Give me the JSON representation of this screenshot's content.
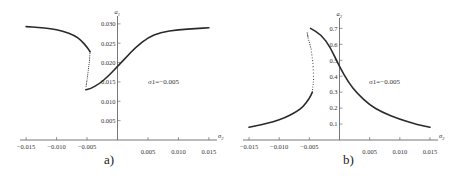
{
  "figure": {
    "panels": [
      {
        "label": "a)",
        "ylabel": "a",
        "ylabel_sub": "1",
        "xlabel": "σ",
        "xlabel_sub": "2",
        "annotation": "σ₁=−0.005"
      },
      {
        "label": "b)",
        "ylabel": "a",
        "ylabel_sub": "2",
        "xlabel": "σ",
        "xlabel_sub": "2",
        "annotation": "σ₁=−0.005"
      }
    ]
  },
  "chart_data": [
    {
      "type": "line",
      "title": "",
      "panel_label": "a)",
      "xlabel": "σ2",
      "ylabel": "a1",
      "annotation": "σ1=−0.005",
      "xlim": [
        -0.016,
        0.016
      ],
      "ylim": [
        0,
        0.031
      ],
      "xticks": [
        -0.015,
        -0.01,
        -0.005,
        0.005,
        0.01,
        0.015
      ],
      "xtick_labels": [
        "−0.015",
        "−0.010",
        "−0.005",
        "0.005",
        "0.010",
        "0.015"
      ],
      "yticks": [
        0.005,
        0.01,
        0.015,
        0.02,
        0.025,
        0.03
      ],
      "ytick_labels": [
        "0.005",
        "0.010",
        "0.015",
        "0.020",
        "0.025",
        "0.030"
      ],
      "grid": false,
      "series": [
        {
          "name": "stable upper branch",
          "style": "solid",
          "x": [
            -0.015,
            -0.013,
            -0.011,
            -0.009,
            -0.007,
            -0.006,
            -0.005,
            -0.0045
          ],
          "y": [
            0.0293,
            0.0291,
            0.0288,
            0.0282,
            0.027,
            0.0258,
            0.024,
            0.0228
          ]
        },
        {
          "name": "unstable branch",
          "style": "dotted",
          "x": [
            -0.0045,
            -0.0046,
            -0.0048,
            -0.005,
            -0.0052
          ],
          "y": [
            0.0228,
            0.0205,
            0.018,
            0.0155,
            0.0135
          ]
        },
        {
          "name": "stable lower branch",
          "style": "solid",
          "x": [
            -0.0052,
            -0.0045,
            -0.003,
            -0.0015,
            0.0,
            0.0015,
            0.003,
            0.005,
            0.007,
            0.01,
            0.013,
            0.015
          ],
          "y": [
            0.013,
            0.0132,
            0.0145,
            0.0165,
            0.019,
            0.0215,
            0.024,
            0.0265,
            0.0278,
            0.0285,
            0.0288,
            0.029
          ]
        }
      ]
    },
    {
      "type": "line",
      "title": "",
      "panel_label": "b)",
      "xlabel": "σ2",
      "ylabel": "a2",
      "annotation": "σ1=−0.005",
      "xlim": [
        -0.016,
        0.016
      ],
      "ylim": [
        0,
        0.74
      ],
      "xticks": [
        -0.015,
        -0.01,
        -0.005,
        0.005,
        0.01,
        0.015
      ],
      "xtick_labels": [
        "−0.015",
        "−0.010",
        "−0.005",
        "0.005",
        "0.010",
        "0.015"
      ],
      "yticks": [
        0.1,
        0.2,
        0.3,
        0.4,
        0.5,
        0.6,
        0.7
      ],
      "ytick_labels": [
        "0.1",
        "0.2",
        "0.3",
        "0.4",
        "0.5",
        "0.6",
        "0.7"
      ],
      "grid": false,
      "series": [
        {
          "name": "stable lower branch",
          "style": "solid",
          "x": [
            -0.015,
            -0.013,
            -0.011,
            -0.009,
            -0.007,
            -0.006,
            -0.005,
            -0.0045
          ],
          "y": [
            0.08,
            0.095,
            0.115,
            0.14,
            0.18,
            0.21,
            0.26,
            0.3
          ]
        },
        {
          "name": "unstable branch",
          "style": "dotted",
          "x": [
            -0.0045,
            -0.0043,
            -0.0044,
            -0.0047,
            -0.0052,
            -0.0054
          ],
          "y": [
            0.3,
            0.38,
            0.48,
            0.57,
            0.64,
            0.68
          ]
        },
        {
          "name": "stable upper branch",
          "style": "solid",
          "x": [
            -0.0048,
            -0.003,
            -0.0015,
            0.0,
            0.0015,
            0.003,
            0.005,
            0.007,
            0.01,
            0.013,
            0.015
          ],
          "y": [
            0.7,
            0.66,
            0.58,
            0.46,
            0.36,
            0.29,
            0.22,
            0.175,
            0.13,
            0.095,
            0.08
          ]
        }
      ]
    }
  ]
}
